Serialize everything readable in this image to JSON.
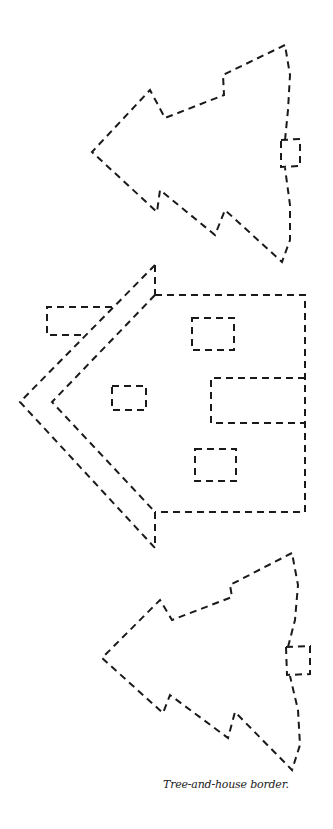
{
  "caption": "Tree-and-house border.",
  "illustration": {
    "style": "dashed cut-out outline",
    "stroke_color": "#1a1a1a",
    "background": "#ffffff",
    "elements": [
      {
        "name": "tree-top",
        "orientation": "rotated, pointing left",
        "has_trunk": true
      },
      {
        "name": "house",
        "orientation": "rotated, roof pointing left",
        "chimney": 1,
        "windows": 3,
        "door": 1
      },
      {
        "name": "tree-bottom",
        "orientation": "rotated, pointing left",
        "has_trunk": true
      }
    ]
  }
}
